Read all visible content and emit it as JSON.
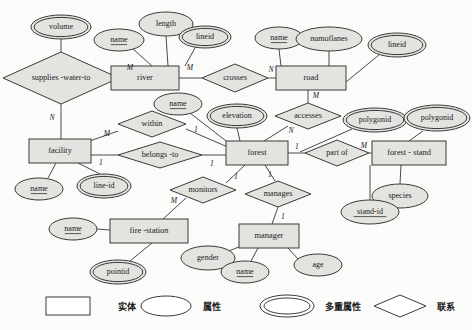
{
  "diagram": {
    "entities": [
      {
        "id": "river",
        "label": "river",
        "x": 145,
        "y": 78,
        "w": 68,
        "h": 24
      },
      {
        "id": "road",
        "label": "road",
        "x": 311,
        "y": 78,
        "w": 70,
        "h": 24
      },
      {
        "id": "facility",
        "label": "facility",
        "x": 60,
        "y": 151,
        "w": 62,
        "h": 24
      },
      {
        "id": "forest",
        "label": "forest",
        "x": 257,
        "y": 153,
        "w": 62,
        "h": 24
      },
      {
        "id": "forest-stand",
        "label": "forest - stand",
        "x": 409,
        "y": 153,
        "w": 74,
        "h": 24
      },
      {
        "id": "fire-station",
        "label": "fire -station",
        "x": 149,
        "y": 231,
        "w": 78,
        "h": 24
      },
      {
        "id": "manager",
        "label": "manager",
        "x": 269,
        "y": 236,
        "w": 60,
        "h": 24
      }
    ],
    "relationships": [
      {
        "id": "supplies-water-to",
        "label": "supplies -water-to",
        "x": 61,
        "y": 78,
        "rx": 58,
        "ry": 26
      },
      {
        "id": "crosses",
        "label": "crosses",
        "x": 235,
        "y": 78,
        "rx": 33,
        "ry": 14
      },
      {
        "id": "within",
        "label": "within",
        "x": 152,
        "y": 124,
        "rx": 34,
        "ry": 13
      },
      {
        "id": "belongs-to",
        "label": "belongs -to",
        "x": 160,
        "y": 155,
        "rx": 42,
        "ry": 13
      },
      {
        "id": "accesses",
        "label": "accesses",
        "x": 308,
        "y": 116,
        "rx": 33,
        "ry": 13
      },
      {
        "id": "part-of",
        "label": "part of",
        "x": 337,
        "y": 153,
        "rx": 32,
        "ry": 13
      },
      {
        "id": "monitors",
        "label": "monitors",
        "x": 203,
        "y": 190,
        "rx": 33,
        "ry": 13
      },
      {
        "id": "manages",
        "label": "manages",
        "x": 278,
        "y": 194,
        "rx": 33,
        "ry": 13
      }
    ],
    "attributes": [
      {
        "id": "volume",
        "label": "volume",
        "x": 61,
        "y": 27,
        "rx": 30,
        "ry": 12,
        "multi": true,
        "key": false
      },
      {
        "id": "river-name",
        "label": "name",
        "x": 119,
        "y": 40,
        "rx": 25,
        "ry": 11,
        "multi": false,
        "key": true
      },
      {
        "id": "length",
        "label": "length",
        "x": 166,
        "y": 24,
        "rx": 27,
        "ry": 12,
        "multi": false,
        "key": false
      },
      {
        "id": "river-lineid",
        "label": "lineid",
        "x": 205,
        "y": 37,
        "rx": 26,
        "ry": 11,
        "multi": true,
        "key": false
      },
      {
        "id": "road-name",
        "label": "name",
        "x": 279,
        "y": 38,
        "rx": 24,
        "ry": 11,
        "multi": false,
        "key": true
      },
      {
        "id": "numoflanes",
        "label": "numoflanes",
        "x": 329,
        "y": 39,
        "rx": 33,
        "ry": 12,
        "multi": false,
        "key": false
      },
      {
        "id": "road-lineid",
        "label": "lineid",
        "x": 397,
        "y": 45,
        "rx": 29,
        "ry": 12,
        "multi": true,
        "key": false
      },
      {
        "id": "forest-name",
        "label": "name",
        "x": 178,
        "y": 104,
        "rx": 24,
        "ry": 11,
        "multi": false,
        "key": true
      },
      {
        "id": "elevation",
        "label": "elevation",
        "x": 237,
        "y": 116,
        "rx": 30,
        "ry": 12,
        "multi": true,
        "key": false
      },
      {
        "id": "forest-polygonid",
        "label": "polygonid",
        "x": 375,
        "y": 120,
        "rx": 32,
        "ry": 12,
        "multi": true,
        "key": false
      },
      {
        "id": "stand-polygonid",
        "label": "polygonid",
        "x": 437,
        "y": 118,
        "rx": 33,
        "ry": 13,
        "multi": true,
        "key": false
      },
      {
        "id": "species",
        "label": "species",
        "x": 400,
        "y": 196,
        "rx": 28,
        "ry": 12,
        "multi": false,
        "key": false
      },
      {
        "id": "stand-id",
        "label": "stand-id",
        "x": 370,
        "y": 212,
        "rx": 29,
        "ry": 12,
        "multi": false,
        "key": true
      },
      {
        "id": "facility-name",
        "label": "name",
        "x": 39,
        "y": 189,
        "rx": 24,
        "ry": 11,
        "multi": false,
        "key": true
      },
      {
        "id": "line-id",
        "label": "line-id",
        "x": 104,
        "y": 186,
        "rx": 27,
        "ry": 12,
        "multi": true,
        "key": false
      },
      {
        "id": "station-name",
        "label": "name",
        "x": 73,
        "y": 229,
        "rx": 24,
        "ry": 11,
        "multi": false,
        "key": true
      },
      {
        "id": "pointid",
        "label": "pointid",
        "x": 118,
        "y": 272,
        "rx": 28,
        "ry": 12,
        "multi": true,
        "key": false
      },
      {
        "id": "gender",
        "label": "gender",
        "x": 208,
        "y": 258,
        "rx": 27,
        "ry": 12,
        "multi": false,
        "key": false
      },
      {
        "id": "manager-name",
        "label": "name",
        "x": 245,
        "y": 272,
        "rx": 24,
        "ry": 11,
        "multi": false,
        "key": true
      },
      {
        "id": "age",
        "label": "age",
        "x": 318,
        "y": 265,
        "rx": 24,
        "ry": 11,
        "multi": false,
        "key": false
      }
    ],
    "edges": [
      {
        "id": "volume-supplies",
        "x1": 61,
        "y1": 39,
        "x2": 61,
        "y2": 52
      },
      {
        "id": "supplies-river",
        "x1": 119,
        "y1": 78,
        "x2": 145,
        "y2": 78
      },
      {
        "id": "supplies-facility",
        "x1": 61,
        "y1": 104,
        "x2": 61,
        "y2": 139
      },
      {
        "id": "rivername-river",
        "x1": 133,
        "y1": 49,
        "x2": 152,
        "y2": 66
      },
      {
        "id": "length-river",
        "x1": 166,
        "y1": 36,
        "x2": 168,
        "y2": 66
      },
      {
        "id": "lineid-river",
        "x1": 196,
        "y1": 46,
        "x2": 185,
        "y2": 66
      },
      {
        "id": "river-crosses",
        "x1": 179,
        "y1": 78,
        "x2": 202,
        "y2": 78
      },
      {
        "id": "crosses-road",
        "x1": 268,
        "y1": 78,
        "x2": 276,
        "y2": 78
      },
      {
        "id": "roadname-road",
        "x1": 279,
        "y1": 49,
        "x2": 281,
        "y2": 66
      },
      {
        "id": "numoflanes-road",
        "x1": 329,
        "y1": 51,
        "x2": 329,
        "y2": 66
      },
      {
        "id": "roadlineid-road",
        "x1": 380,
        "y1": 54,
        "x2": 346,
        "y2": 82
      },
      {
        "id": "road-accesses",
        "x1": 308,
        "y1": 90,
        "x2": 308,
        "y2": 103
      },
      {
        "id": "accesses-forest",
        "x1": 288,
        "y1": 126,
        "x2": 264,
        "y2": 141
      },
      {
        "id": "forestname-forest",
        "x1": 190,
        "y1": 113,
        "x2": 230,
        "y2": 144
      },
      {
        "id": "elevation-forest",
        "x1": 237,
        "y1": 128,
        "x2": 240,
        "y2": 141
      },
      {
        "id": "forest-partof",
        "x1": 288,
        "y1": 153,
        "x2": 305,
        "y2": 153
      },
      {
        "id": "partof-stand",
        "x1": 369,
        "y1": 153,
        "x2": 372,
        "y2": 153
      },
      {
        "id": "polygonid-forest",
        "x1": 352,
        "y1": 129,
        "x2": 300,
        "y2": 152
      },
      {
        "id": "standpoly-stand",
        "x1": 423,
        "y1": 131,
        "x2": 409,
        "y2": 141
      },
      {
        "id": "species-stand",
        "x1": 400,
        "y1": 184,
        "x2": 401,
        "y2": 165
      },
      {
        "id": "standid-stand",
        "x1": 370,
        "y1": 200,
        "x2": 370,
        "y2": 165
      },
      {
        "id": "within-facility",
        "x1": 118,
        "y1": 131,
        "x2": 87,
        "y2": 142
      },
      {
        "id": "within-forest",
        "x1": 186,
        "y1": 129,
        "x2": 230,
        "y2": 148
      },
      {
        "id": "facility-belongs",
        "x1": 91,
        "y1": 155,
        "x2": 118,
        "y2": 155
      },
      {
        "id": "belongs-forest",
        "x1": 202,
        "y1": 155,
        "x2": 226,
        "y2": 155
      },
      {
        "id": "facname-facility",
        "x1": 48,
        "y1": 178,
        "x2": 56,
        "y2": 163
      },
      {
        "id": "lineid-facility",
        "x1": 100,
        "y1": 174,
        "x2": 78,
        "y2": 163
      },
      {
        "id": "station-monitors",
        "x1": 163,
        "y1": 219,
        "x2": 186,
        "y2": 198
      },
      {
        "id": "monitors-forest",
        "x1": 226,
        "y1": 183,
        "x2": 245,
        "y2": 165
      },
      {
        "id": "statname-station",
        "x1": 97,
        "y1": 229,
        "x2": 110,
        "y2": 230
      },
      {
        "id": "pointid-station",
        "x1": 130,
        "y1": 261,
        "x2": 152,
        "y2": 243
      },
      {
        "id": "forest-manages",
        "x1": 265,
        "y1": 165,
        "x2": 275,
        "y2": 181
      },
      {
        "id": "manages-manager",
        "x1": 278,
        "y1": 207,
        "x2": 272,
        "y2": 224
      },
      {
        "id": "gender-manager",
        "x1": 226,
        "y1": 252,
        "x2": 244,
        "y2": 245
      },
      {
        "id": "mgrname-manager",
        "x1": 251,
        "y1": 261,
        "x2": 258,
        "y2": 248
      },
      {
        "id": "age-manager",
        "x1": 299,
        "y1": 260,
        "x2": 288,
        "y2": 248
      }
    ],
    "cardinalities": [
      {
        "id": "card-supplies-river",
        "label": "M",
        "x": 130,
        "y": 68
      },
      {
        "id": "card-supplies-n",
        "label": "N",
        "x": 52,
        "y": 118
      },
      {
        "id": "card-river-crosses",
        "label": "M",
        "x": 190,
        "y": 68
      },
      {
        "id": "card-crosses-road",
        "label": "N",
        "x": 271,
        "y": 70
      },
      {
        "id": "card-road-accesses",
        "label": "M",
        "x": 316,
        "y": 96
      },
      {
        "id": "card-accesses-forest",
        "label": "N",
        "x": 291,
        "y": 131
      },
      {
        "id": "card-within-m",
        "label": "M",
        "x": 107,
        "y": 134
      },
      {
        "id": "card-within-1",
        "label": "1",
        "x": 196,
        "y": 130
      },
      {
        "id": "card-belongs-1l",
        "label": "1",
        "x": 101,
        "y": 163
      },
      {
        "id": "card-belongs-1r",
        "label": "1",
        "x": 212,
        "y": 164
      },
      {
        "id": "card-forest-partof",
        "label": "1",
        "x": 297,
        "y": 147
      },
      {
        "id": "card-partof-stand",
        "label": "M",
        "x": 364,
        "y": 146
      },
      {
        "id": "card-monitors-m",
        "label": "M",
        "x": 174,
        "y": 201
      },
      {
        "id": "card-monitors-1",
        "label": "1",
        "x": 236,
        "y": 177
      },
      {
        "id": "card-manages-1t",
        "label": "1",
        "x": 270,
        "y": 175
      },
      {
        "id": "card-manages-1b",
        "label": "1",
        "x": 283,
        "y": 217
      }
    ],
    "legend": [
      {
        "id": "legend-entity",
        "shape": "rect",
        "label": "实体",
        "sx": 68,
        "sy": 306,
        "lx": 118,
        "ly": 307
      },
      {
        "id": "legend-attribute",
        "shape": "ellipse",
        "label": "属性",
        "sx": 166,
        "sy": 306,
        "lx": 203,
        "ly": 307
      },
      {
        "id": "legend-multi",
        "shape": "double",
        "label": "多重属性",
        "sx": 287,
        "sy": 306,
        "lx": 325,
        "ly": 307
      },
      {
        "id": "legend-relationship",
        "shape": "diamond",
        "label": "联系",
        "sx": 400,
        "sy": 306,
        "lx": 437,
        "ly": 307
      }
    ]
  }
}
